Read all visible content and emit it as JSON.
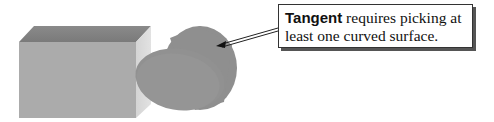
{
  "callout": {
    "bold_term": "Tangent",
    "text_rest": " requires picking at least one curved surface."
  },
  "shapes": [
    {
      "type": "box",
      "color": "#a9a9a9"
    },
    {
      "type": "cylinder",
      "color": "#8c8c8c"
    }
  ]
}
